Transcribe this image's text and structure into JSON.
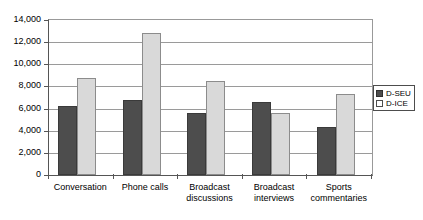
{
  "chart_data": {
    "type": "bar",
    "title": "",
    "xlabel": "",
    "ylabel": "",
    "categories": [
      "Conversation",
      "Phone calls",
      "Broadcast discussions",
      "Broadcast interviews",
      "Sports commentaries"
    ],
    "category_lines": [
      [
        "Conversation"
      ],
      [
        "Phone calls"
      ],
      [
        "Broadcast",
        "discussions"
      ],
      [
        "Broadcast",
        "interviews"
      ],
      [
        "Sports",
        "commentaries"
      ]
    ],
    "series": [
      {
        "name": "D-SEU",
        "color": "#4d4d4d",
        "values": [
          6200,
          6800,
          5600,
          6600,
          4300
        ]
      },
      {
        "name": "D-ICE",
        "color": "#d9d9d9",
        "values": [
          8800,
          12800,
          8500,
          5600,
          7300
        ]
      }
    ],
    "ylim": [
      0,
      14000
    ],
    "ytick_values": [
      0,
      2000,
      4000,
      6000,
      8000,
      10000,
      12000,
      14000
    ],
    "ytick_labels": [
      "0",
      "2,000",
      "4,000",
      "6,000",
      "8,000",
      "10,000",
      "12,000",
      "14,000"
    ],
    "grid": true,
    "legend_position": "right",
    "legend": [
      {
        "label": "D-SEU",
        "swatch": "dark"
      },
      {
        "label": "D-ICE",
        "swatch": "light"
      }
    ]
  }
}
